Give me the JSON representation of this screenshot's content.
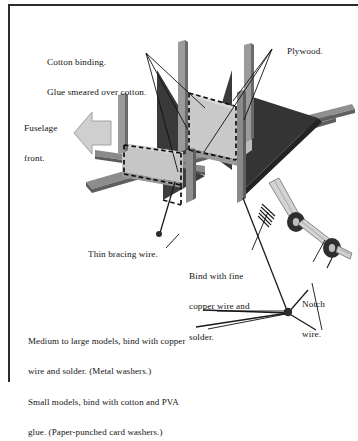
{
  "figure": {
    "kind": "isometric-technical-illustration",
    "colors": {
      "ink": "#141414",
      "plywood_light": "#c9c9c9",
      "plywood_shadow": "#9a9a9a",
      "gusset_dark": "#3a3a3a",
      "longeron_mid": "#8d8d8d",
      "longeron_dark": "#585858",
      "arrow_fill": "#cfcfcf",
      "arrow_stroke": "#9b9b9b",
      "washer_dark": "#2e2e2e",
      "page_rule": "#2b2b2b"
    }
  },
  "labels": {
    "cotton_binding": {
      "line1": "Cotton binding.",
      "line2": "Glue smeared over cotton."
    },
    "plywood": "Plywood.",
    "fuselage_front": {
      "line1": "Fuselage",
      "line2": "front."
    },
    "thin_bracing_wire": "Thin bracing wire.",
    "bind_copper": {
      "line1": "Bind with fine",
      "line2": "copper wire and",
      "line3": "solder."
    },
    "notch_wire": {
      "line1": "Notch",
      "line2": "wire."
    },
    "washer_note": {
      "line1": "Medium to large models, bind with copper",
      "line2": "wire and solder. (Metal washers.)",
      "line3": "Small models, bind with cotton and PVA",
      "line4": "glue. (Paper-punched card washers.)"
    }
  }
}
